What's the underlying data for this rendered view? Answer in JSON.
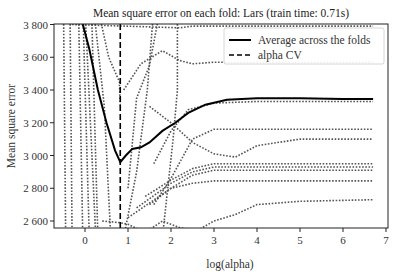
{
  "chart_data": {
    "type": "line",
    "title": "Mean square error on each fold: Lars (train time: 0.71s)",
    "xlabel": "log(alpha)",
    "ylabel": "Mean square error",
    "xlim": [
      -0.75,
      7.05
    ],
    "ylim": [
      2500,
      3800
    ],
    "xticks": [
      0,
      1,
      2,
      3,
      4,
      5,
      6,
      7
    ],
    "xtick_labels": [
      "0",
      "1",
      "2",
      "3",
      "4",
      "5",
      "6",
      "7"
    ],
    "yticks": [
      2600,
      2800,
      3000,
      3200,
      3400,
      3600,
      3800
    ],
    "ytick_labels": [
      "2 600",
      "2 800",
      "3 000",
      "3 200",
      "3 400",
      "3 600",
      "3 800"
    ],
    "grid": false,
    "legend": {
      "position": "upper right",
      "entries": [
        {
          "label": "Average across the folds",
          "style": "solid"
        },
        {
          "label": "alpha CV",
          "style": "dashed"
        }
      ]
    },
    "alpha_cv": 0.82,
    "series": [
      {
        "name": "Average across the folds",
        "style": "solid",
        "color": "#000000",
        "x": [
          -0.1,
          0.1,
          0.3,
          0.5,
          0.7,
          0.82,
          0.95,
          1.1,
          1.3,
          1.5,
          1.8,
          2.1,
          2.4,
          2.8,
          3.3,
          4.0,
          5.0,
          6.0,
          6.7
        ],
        "y": [
          3850,
          3650,
          3400,
          3200,
          3030,
          2960,
          3000,
          3040,
          3050,
          3080,
          3150,
          3200,
          3260,
          3310,
          3340,
          3350,
          3350,
          3345,
          3345
        ]
      },
      {
        "name": "fold-1",
        "style": "dotted",
        "x": [
          -0.3,
          2.2,
          2.5,
          3.0,
          4.0,
          5.0,
          6.7
        ],
        "y": [
          3800,
          3780,
          3790,
          3790,
          3790,
          3790,
          3790
        ]
      },
      {
        "name": "fold-2",
        "style": "dotted",
        "x": [
          0.9,
          1.3,
          1.8,
          2.2,
          2.5,
          3.0,
          4.0,
          5.0,
          6.7
        ],
        "y": [
          3400,
          3560,
          3640,
          3580,
          3560,
          3570,
          3570,
          3570,
          3570
        ]
      },
      {
        "name": "fold-3",
        "style": "dotted",
        "x": [
          1.6,
          2.0,
          2.4,
          3.0,
          4.0,
          5.0,
          6.7
        ],
        "y": [
          2950,
          3150,
          3280,
          3320,
          3330,
          3330,
          3330
        ]
      },
      {
        "name": "fold-4",
        "style": "dotted",
        "x": [
          1.5,
          2.0,
          2.5,
          3.0,
          3.5,
          4.0,
          5.0,
          6.7
        ],
        "y": [
          3300,
          3200,
          3080,
          3010,
          2990,
          3060,
          3100,
          3100
        ]
      },
      {
        "name": "fold-5",
        "style": "dotted",
        "x": [
          1.6,
          2.0,
          2.5,
          3.0,
          4.0,
          5.0,
          6.7
        ],
        "y": [
          2700,
          2860,
          3100,
          3160,
          3160,
          3160,
          3160
        ]
      },
      {
        "name": "fold-6",
        "style": "dotted",
        "x": [
          1.4,
          2.0,
          2.5,
          3.0,
          4.0,
          6.7
        ],
        "y": [
          2750,
          2850,
          2920,
          2950,
          2950,
          2950
        ]
      },
      {
        "name": "fold-7",
        "style": "dotted",
        "x": [
          1.2,
          2.0,
          2.5,
          3.0,
          4.0,
          6.7
        ],
        "y": [
          2680,
          2830,
          2900,
          2930,
          2930,
          2930
        ]
      },
      {
        "name": "fold-8",
        "style": "dotted",
        "x": [
          1.0,
          2.0,
          2.5,
          3.0,
          4.0,
          6.7
        ],
        "y": [
          2620,
          2800,
          2880,
          2910,
          2910,
          2910
        ]
      },
      {
        "name": "fold-9",
        "style": "dotted",
        "x": [
          1.5,
          2.0,
          2.5,
          3.0,
          4.0,
          6.7
        ],
        "y": [
          2700,
          2800,
          2830,
          2845,
          2845,
          2845
        ]
      },
      {
        "name": "fold-10",
        "style": "dotted",
        "x": [
          0.4,
          0.8,
          1.0,
          1.4,
          1.8,
          2.2,
          2.6,
          3.0,
          3.5,
          4.0,
          5.0,
          6.7
        ],
        "y": [
          2600,
          2590,
          2580,
          2530,
          2600,
          2560,
          2540,
          2600,
          2640,
          2700,
          2720,
          2730
        ]
      }
    ]
  },
  "legend": {
    "average_label": "Average across the folds",
    "alpha_label": "alpha CV"
  },
  "title": "Mean square error on each fold: Lars (train time: 0.71s)",
  "xlabel": "log(alpha)",
  "ylabel": "Mean square error",
  "colors": {
    "average": "#000000",
    "folds": "#555555",
    "axis": "#222222"
  }
}
